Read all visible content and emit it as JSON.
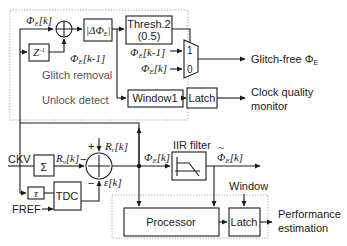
{
  "diagram": {
    "groups": {
      "glitch_removal": "Glitch removal",
      "unlock_detect": "Unlock detect"
    },
    "blocks": {
      "delay": "Z",
      "delay_exp": "-1",
      "abs_delta": "|ΔΦ",
      "abs_delta_sub": "E",
      "abs_delta_close": "|",
      "thresh_line1": "Thresh.2",
      "thresh_line2": "(0.5)",
      "window1": "Window1",
      "latch_top": "Latch",
      "sigma": "Σ",
      "tau": "τ",
      "tdc": "TDC",
      "iir_filter": "IIR filter",
      "processor": "Processor",
      "latch_bottom": "Latch"
    },
    "signals": {
      "phi_e_k": "Φ",
      "phi_sub": "E",
      "k": "[k]",
      "k_minus_1": "[k-1]",
      "mux_in1": "1",
      "mux_in0": "0",
      "rv_k": "R",
      "rv_sub": "v",
      "rr_k": "R",
      "rr_sub": "r",
      "eps_k": "ε[k]",
      "ckv": "CKV",
      "fref": "FREF",
      "plus": "+",
      "minus": "−",
      "window": "Window",
      "phi_tilde": "~"
    },
    "outputs": {
      "glitch_free": "Glitch-free Φ",
      "glitch_free_sub": "E",
      "clock_quality_line1": "Clock quality",
      "clock_quality_line2": "monitor",
      "performance_line1": "Performance",
      "performance_line2": "estimation"
    },
    "colors": {
      "line": "#1a1a1a",
      "dotted_border": "#9a9a9a",
      "group_label": "#555555"
    }
  }
}
